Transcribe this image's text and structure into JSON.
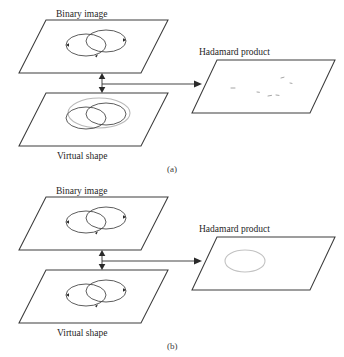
{
  "figure": {
    "caption_a": "(a)",
    "caption_b": "(b)",
    "panels": [
      {
        "id": "a",
        "label": "(a)",
        "planes": {
          "binary_image": {
            "label": "Binary image",
            "label_position": "top",
            "contents": "two overlapping circles"
          },
          "virtual_shape": {
            "label": "Virtual shape",
            "label_position": "bottom",
            "contents": "two overlapping circles plus grey virtual ellipse"
          },
          "hadamard_product": {
            "label": "Hadamard product",
            "label_position": "top",
            "contents": "sparse scattered fragments"
          }
        },
        "connectors": {
          "vertical": "double-headed-arrow",
          "horizontal": "right-arrow"
        }
      },
      {
        "id": "b",
        "label": "(b)",
        "planes": {
          "binary_image": {
            "label": "Binary image",
            "label_position": "top",
            "contents": "two overlapping circles"
          },
          "virtual_shape": {
            "label": "Virtual shape",
            "label_position": "bottom",
            "contents": "two overlapping circles"
          },
          "hadamard_product": {
            "label": "Hadamard product",
            "label_position": "top",
            "contents": "single grey ellipse"
          }
        },
        "connectors": {
          "vertical": "double-headed-arrow",
          "horizontal": "right-arrow"
        }
      }
    ],
    "colors": {
      "plane_stroke": "#3c3c3c",
      "shape_stroke": "#404040",
      "virtual_stroke": "#b9b9b9",
      "product_stroke": "#c2c2c2",
      "text": "#262626",
      "background": "#ffffff"
    }
  }
}
